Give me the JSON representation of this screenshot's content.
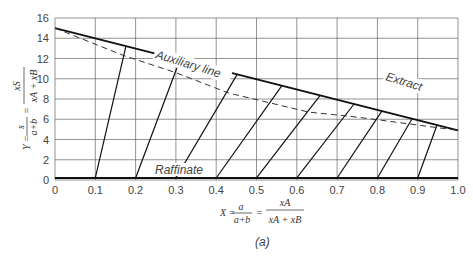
{
  "chart_data": {
    "type": "line",
    "title": "",
    "caption": "(a)",
    "xlabel": "X = a/(a+b) = xA/(xA+xB)",
    "ylabel": "Y = s/(a+b) = xS/(xA+xB)",
    "xlim": [
      0,
      1.0
    ],
    "ylim": [
      0,
      16
    ],
    "grid": true,
    "x_ticks": [
      "0",
      "0.1",
      "0.2",
      "0.3",
      "0.4",
      "0.5",
      "0.6",
      "0.7",
      "0.8",
      "0.9",
      "1.0"
    ],
    "y_ticks": [
      "0",
      "2",
      "4",
      "6",
      "8",
      "10",
      "12",
      "14",
      "16"
    ],
    "series": [
      {
        "name": "Extract",
        "style": "solid-thick",
        "x": [
          0,
          1.0
        ],
        "y": [
          15.0,
          4.9
        ]
      },
      {
        "name": "Auxiliary line",
        "style": "dashed",
        "x": [
          0,
          0.17,
          0.3,
          0.43,
          0.63,
          0.73,
          0.81,
          1.0
        ],
        "y": [
          15.0,
          12.3,
          10.6,
          8.6,
          6.7,
          6.3,
          5.9,
          4.9
        ]
      },
      {
        "name": "Raffinate",
        "style": "solid-thick",
        "x": [
          0,
          1.0
        ],
        "y": [
          0.2,
          0.2
        ]
      }
    ],
    "tie_lines": [
      {
        "raffinate_x": 0.1,
        "extract_x": 0.176
      },
      {
        "raffinate_x": 0.2,
        "extract_x": 0.31
      },
      {
        "raffinate_x": 0.3,
        "extract_x": 0.452
      },
      {
        "raffinate_x": 0.4,
        "extract_x": 0.563
      },
      {
        "raffinate_x": 0.5,
        "extract_x": 0.658
      },
      {
        "raffinate_x": 0.6,
        "extract_x": 0.742
      },
      {
        "raffinate_x": 0.7,
        "extract_x": 0.811
      },
      {
        "raffinate_x": 0.8,
        "extract_x": 0.886
      },
      {
        "raffinate_x": 0.9,
        "extract_x": 0.948
      }
    ],
    "annotations": [
      "Auxiliary line",
      "Extract",
      "Raffinate"
    ]
  },
  "labels": {
    "extract": "Extract",
    "auxiliary": "Auxiliary line",
    "raffinate": "Raffinate",
    "caption": "(a)",
    "x_axis_lhs": "X = ",
    "x_axis_frac1_num": "a",
    "x_axis_frac1_den": "a+b",
    "x_axis_frac2_num": "xA",
    "x_axis_frac2_den": "xA + xB",
    "y_axis_lhs": "Y = ",
    "y_axis_frac1_num": "s",
    "y_axis_frac1_den": "a+b",
    "y_axis_frac2_num": "xS",
    "y_axis_frac2_den": "xA + xB"
  }
}
